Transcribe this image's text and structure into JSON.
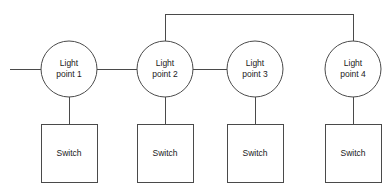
{
  "diagram": {
    "type": "schematic",
    "background_color": "#ffffff",
    "line_color": "#4a4a4a",
    "text_color": "#1a1a1a",
    "light_points": [
      {
        "id": "light-point-1",
        "label_line1": "Light",
        "label_line2": "point 1",
        "cx": 69,
        "cy": 69,
        "r": 28
      },
      {
        "id": "light-point-2",
        "label_line1": "Light",
        "label_line2": "point 2",
        "cx": 165,
        "cy": 69,
        "r": 28
      },
      {
        "id": "light-point-3",
        "label_line1": "Light",
        "label_line2": "point 3",
        "cx": 255,
        "cy": 69,
        "r": 28
      },
      {
        "id": "light-point-4",
        "label_line1": "Light",
        "label_line2": "point 4",
        "cx": 353,
        "cy": 69,
        "r": 28
      }
    ],
    "switches": [
      {
        "id": "switch-1",
        "label": "Switch",
        "x": 41,
        "y": 124,
        "width": 56,
        "height": 58
      },
      {
        "id": "switch-2",
        "label": "Switch",
        "x": 137,
        "y": 124,
        "width": 56,
        "height": 58
      },
      {
        "id": "switch-3",
        "label": "Switch",
        "x": 227,
        "y": 124,
        "width": 56,
        "height": 58
      },
      {
        "id": "switch-4",
        "label": "Switch",
        "x": 325,
        "y": 124,
        "width": 56,
        "height": 58
      }
    ],
    "wires": [
      {
        "id": "supply-feed-wire",
        "description": "incoming supply line to light point 1",
        "path": "M 10 69 L 41 69"
      },
      {
        "id": "wire-lp1-lp2",
        "description": "horizontal link light point 1 to light point 2",
        "path": "M 97 69 L 137 69"
      },
      {
        "id": "wire-lp2-lp3",
        "description": "horizontal link light point 2 to light point 3",
        "path": "M 193 69 L 227 69"
      },
      {
        "id": "wire-lp2-lp4-overhead",
        "description": "overhead bus from light point 2 up, across and down to light point 4",
        "path": "M 165 41 L 165 14 L 353 14 L 353 41"
      },
      {
        "id": "wire-lp1-switch1",
        "description": "drop from light point 1 to switch 1",
        "path": "M 69 97 L 69 124"
      },
      {
        "id": "wire-lp2-switch2",
        "description": "drop from light point 2 to switch 2",
        "path": "M 165 97 L 165 124"
      },
      {
        "id": "wire-lp3-switch3",
        "description": "drop from light point 3 to switch 3",
        "path": "M 255 97 L 255 124"
      },
      {
        "id": "wire-lp4-switch4",
        "description": "drop from light point 4 to switch 4",
        "path": "M 353 97 L 353 124"
      }
    ]
  }
}
